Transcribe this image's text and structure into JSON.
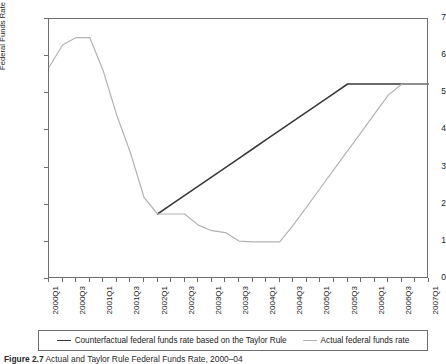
{
  "figure": {
    "caption_label": "Figure 2.7",
    "caption_text": "Actual and Taylor Rule Federal Funds Rate, 2000–04"
  },
  "legend": {
    "position": "bottom",
    "entries": [
      {
        "label": "Counterfactual federal funds rate based on the Taylor Rule",
        "color": "#3a3a3a",
        "style": "dark"
      },
      {
        "label": "Actual federal funds rate",
        "color": "#b3b3b3",
        "style": "light"
      }
    ]
  },
  "chart_data": {
    "type": "line",
    "title": "",
    "subtitle": "",
    "xlabel": "",
    "ylabel": "Federal Funds Rate (Percent)",
    "ylim": [
      0,
      7
    ],
    "ytick_labels": [
      "0",
      "1",
      "2",
      "3",
      "4",
      "5",
      "6",
      "7"
    ],
    "yticks": [
      0,
      1,
      2,
      3,
      4,
      5,
      6,
      7
    ],
    "grid": false,
    "x": [
      "2000Q1",
      "2000Q2",
      "2000Q3",
      "2000Q4",
      "2001Q1",
      "2001Q2",
      "2001Q3",
      "2001Q4",
      "2002Q1",
      "2002Q2",
      "2002Q3",
      "2002Q4",
      "2003Q1",
      "2003Q2",
      "2003Q3",
      "2003Q4",
      "2004Q1",
      "2004Q2",
      "2004Q3",
      "2004Q4",
      "2005Q1",
      "2005Q2",
      "2005Q3",
      "2005Q4",
      "2006Q1",
      "2006Q2",
      "2006Q3",
      "2006Q4",
      "2007Q1"
    ],
    "xtick_labels": [
      "2000Q1",
      "2000Q3",
      "2001Q1",
      "2001Q3",
      "2002Q1",
      "2002Q3",
      "2003Q1",
      "2003Q3",
      "2004Q1",
      "2004Q3",
      "2005Q1",
      "2005Q3",
      "2006Q1",
      "2006Q3",
      "2007Q1"
    ],
    "xtick_every": 2,
    "series": [
      {
        "name": "Counterfactual federal funds rate based on the Taylor Rule",
        "color": "#3a3a3a",
        "width": 1.6,
        "values": [
          null,
          null,
          null,
          null,
          null,
          null,
          null,
          null,
          1.75,
          2.0,
          2.25,
          2.5,
          2.75,
          3.0,
          3.25,
          3.5,
          3.75,
          4.0,
          4.25,
          4.5,
          4.75,
          5.0,
          5.25,
          5.25,
          5.25,
          5.25,
          5.25,
          5.25,
          5.25
        ]
      },
      {
        "name": "Actual federal funds rate",
        "color": "#b3b3b3",
        "width": 1.2,
        "values": [
          5.7,
          6.3,
          6.5,
          6.5,
          5.6,
          4.4,
          3.4,
          2.2,
          1.75,
          1.75,
          1.75,
          1.45,
          1.3,
          1.25,
          1.02,
          1.0,
          1.0,
          1.0,
          1.45,
          1.95,
          2.45,
          2.95,
          3.45,
          3.95,
          4.45,
          4.95,
          5.25,
          5.25,
          5.25
        ]
      }
    ]
  }
}
